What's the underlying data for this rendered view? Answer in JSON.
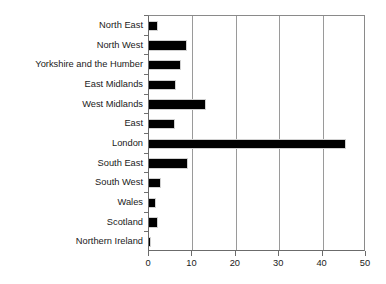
{
  "chart_data": {
    "type": "bar",
    "orientation": "horizontal",
    "title": "",
    "subtitle": "",
    "xlabel": "",
    "ylabel": "",
    "xlim": [
      0,
      50
    ],
    "xticks": [
      0,
      10,
      20,
      30,
      40,
      50
    ],
    "xtick_labels": [
      "0",
      "10",
      "20",
      "30",
      "40",
      "50"
    ],
    "grid": "vertical",
    "legend": "none",
    "bar_color": "#000000",
    "gridline_color": "#9a9a9a",
    "axis_color": "#6b6b6b",
    "background_color": "#ffffff",
    "categories": [
      "North East",
      "North West",
      "Yorkshire and the Humber",
      "East Midlands",
      "West Midlands",
      "East",
      "London",
      "South East",
      "South West",
      "Wales",
      "Scotland",
      "Northern Ireland"
    ],
    "values": [
      2.0,
      8.7,
      7.3,
      6.2,
      13.1,
      6.0,
      45.3,
      9.0,
      2.8,
      1.6,
      2.1,
      0.4
    ],
    "series": [
      {
        "name": "",
        "values": [
          2.0,
          8.7,
          7.3,
          6.2,
          13.1,
          6.0,
          45.3,
          9.0,
          2.8,
          1.6,
          2.1,
          0.4
        ]
      }
    ],
    "annotations": []
  }
}
